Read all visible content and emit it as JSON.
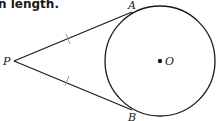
{
  "caption": "n length.",
  "diagram": {
    "points": {
      "P": {
        "label": "P",
        "x": 14,
        "y": 61
      },
      "A": {
        "label": "A",
        "x": 132,
        "y": 13
      },
      "B": {
        "label": "B",
        "x": 132,
        "y": 110
      },
      "O": {
        "label": "O",
        "x": 160,
        "y": 61
      }
    },
    "circle": {
      "center": "O",
      "radius": 55
    },
    "segments": [
      {
        "from": "P",
        "to": "A",
        "tick_marks": 1
      },
      {
        "from": "P",
        "to": "B",
        "tick_marks": 1
      }
    ],
    "colors": {
      "stroke": "#1a1a1a",
      "tick": "#999999"
    }
  }
}
